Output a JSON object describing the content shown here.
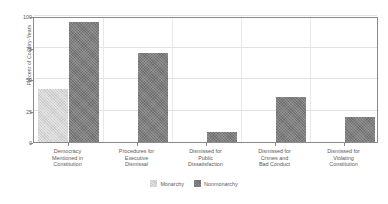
{
  "chart_data": {
    "type": "bar",
    "title": "",
    "xlabel": "",
    "ylabel": "Percent of Country-Years",
    "ylim": [
      0,
      100
    ],
    "yticks": [
      0,
      25,
      50,
      75,
      100
    ],
    "ytick_labels": [
      "0",
      "25",
      "50",
      "75",
      "100"
    ],
    "grid": true,
    "legend_position": "bottom",
    "categories": [
      "Democracy Mentioned in Constitution",
      "Procedures for Executive Dismissal",
      "Dismissed for Public Dissatisfaction",
      "Dismissed for Crimes and Bad Conduct",
      "Dismissed for Violating Constitution"
    ],
    "category_lines": [
      [
        "Democracy",
        "Mentioned in",
        "Constitution"
      ],
      [
        "Procedures for",
        "Executive",
        "Dismissal"
      ],
      [
        "Dismissed for",
        "Public",
        "Dissatisfaction"
      ],
      [
        "Dismissed for",
        "Crimes and",
        "Bad Conduct"
      ],
      [
        "Dismissed for",
        "Violating",
        "Constitution"
      ]
    ],
    "series": [
      {
        "name": "Monarchy",
        "color": "#c8c8c8",
        "values": [
          42,
          0,
          0,
          0,
          0
        ]
      },
      {
        "name": "Nonmonarchy",
        "color": "#6e6e6e",
        "values": [
          95,
          71,
          8,
          36,
          20
        ]
      }
    ]
  },
  "legend": {
    "items": [
      {
        "label": "Monarchy",
        "color": "#c8c8c8"
      },
      {
        "label": "Nonmonarchy",
        "color": "#6e6e6e"
      }
    ]
  },
  "axis": {
    "y_title": "Percent of Country-Years"
  }
}
